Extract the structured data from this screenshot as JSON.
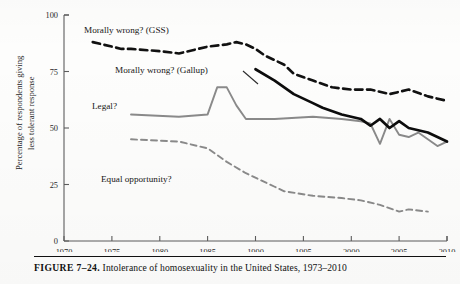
{
  "figure": {
    "label": "FIGURE 7–24.",
    "caption": "Intolerance of homosexuality in the United States, 1973–2010",
    "caption_full": "FIGURE 7–24. Intolerance of homosexuality in the United States, 1973–2010"
  },
  "colors": {
    "gss": "#111111",
    "gallup": "#0c0c0c",
    "legal": "#8a8a8a",
    "equal_opportunity": "#8a8a8a",
    "axis": "#5d5d5d",
    "background": "#fdfdfc"
  },
  "annotations": {
    "gss_label": "Morally wrong? (GSS)",
    "gallup_label": "Morally wrong? (Gallup)",
    "legal_label": "Legal?",
    "equal_label": "Equal opportunity?"
  },
  "axes": {
    "y_title_line1": "Percentage of respondents giving",
    "y_title_line2": "less tolerant response",
    "y_ticks": [
      "0",
      "25",
      "50",
      "75",
      "100"
    ],
    "x_ticks": [
      "1970",
      "1975",
      "1980",
      "1985",
      "1990",
      "1995",
      "2000",
      "2005",
      "2010"
    ]
  },
  "chart_data": {
    "type": "line",
    "title": "Intolerance of homosexuality in the United States, 1973–2010",
    "xlabel": "",
    "ylabel": "Percentage of respondents giving less tolerant response",
    "xlim": [
      1970,
      2010
    ],
    "ylim": [
      0,
      100
    ],
    "grid": false,
    "legend": "inline annotations",
    "series": [
      {
        "name": "Morally wrong? (GSS)",
        "style": "dashed",
        "color": "#111111",
        "x": [
          1973,
          1974,
          1976,
          1977,
          1980,
          1982,
          1984,
          1985,
          1987,
          1988,
          1989,
          1990,
          1991,
          1993,
          1994,
          1996,
          1998,
          2000,
          2002,
          2004,
          2006,
          2008,
          2010
        ],
        "y": [
          88,
          87,
          85,
          85,
          84,
          83,
          85,
          86,
          87,
          88,
          87,
          85,
          82,
          78,
          74,
          71,
          68,
          67,
          67,
          65,
          67,
          64,
          62
        ]
      },
      {
        "name": "Morally wrong? (Gallup)",
        "style": "solid",
        "color": "#0c0c0c",
        "x": [
          1990,
          1992,
          1994,
          1996,
          1997,
          1999,
          2001,
          2002,
          2003,
          2004,
          2005,
          2006,
          2007,
          2008,
          2009,
          2010
        ],
        "y": [
          76,
          71,
          65,
          61,
          59,
          56,
          54,
          51,
          54,
          50,
          53,
          50,
          49,
          48,
          46,
          44
        ]
      },
      {
        "name": "Legal?",
        "style": "solid",
        "color": "#8a8a8a",
        "x": [
          1977,
          1982,
          1985,
          1986,
          1987,
          1988,
          1989,
          1992,
          1996,
          1999,
          2001,
          2002,
          2003,
          2004,
          2005,
          2006,
          2007,
          2008,
          2009,
          2010
        ],
        "y": [
          56,
          55,
          56,
          68,
          68,
          60,
          54,
          54,
          55,
          54,
          53,
          52,
          43,
          54,
          47,
          46,
          48,
          45,
          42,
          44
        ]
      },
      {
        "name": "Equal opportunity?",
        "style": "dashed",
        "color": "#8a8a8a",
        "x": [
          1977,
          1982,
          1985,
          1987,
          1989,
          1992,
          1993,
          1996,
          1999,
          2001,
          2003,
          2005,
          2006,
          2008
        ],
        "y": [
          45,
          44,
          41,
          35,
          30,
          24,
          22,
          20,
          19,
          18,
          16,
          13,
          14,
          13
        ]
      }
    ]
  }
}
